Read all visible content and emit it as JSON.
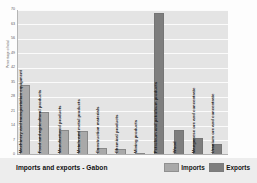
{
  "chart": {
    "title": "Imports and exports - Gabon",
    "ylabel": "Percentage of total"
  },
  "legend": {
    "items": [
      {
        "label": "Imports",
        "color": "#a9a9a9"
      },
      {
        "label": "Exports",
        "color": "#7e7e7e"
      }
    ]
  },
  "colors": {
    "imports": "#a9a9a9",
    "exports": "#7e7e7e",
    "plot_background": "#e4e4e4",
    "gridline": "#fbfbfb",
    "footer_background": "#ededed"
  },
  "chart_data": {
    "type": "bar",
    "title": "Imports and exports - Gabon",
    "subtitle": "",
    "xlabel": "",
    "ylabel": "Percentage of total",
    "ylim": [
      0,
      70
    ],
    "yticks": [
      0,
      7,
      14,
      21,
      28,
      35,
      42,
      49,
      56,
      63,
      70
    ],
    "ytick_labels": [
      "0",
      "7",
      "14",
      "21",
      "28",
      "35",
      "42",
      "49",
      "56",
      "63",
      "70"
    ],
    "grid": true,
    "grid_axis": "y",
    "legend_position": "bottom-right",
    "orientation": "vertical",
    "categories": [
      "Machinery and transportation equipment",
      "Food and agricultural products",
      "Manufactured products",
      "Metals and metal products",
      "Construction materials",
      "Chemical products",
      "Mining products",
      "Petroleum and petroleum products",
      "Wood",
      "Manganese ore and concentrate",
      "Uranium ore and concentrate"
    ],
    "series": [
      {
        "name": "Imports",
        "color": "#a9a9a9",
        "values": [
          34,
          21,
          12,
          11.5,
          3.5,
          3,
          0.7,
          null,
          null,
          null,
          null
        ]
      },
      {
        "name": "Exports",
        "color": "#7e7e7e",
        "values": [
          null,
          null,
          null,
          null,
          null,
          null,
          null,
          68.5,
          12,
          8,
          5.5
        ]
      }
    ],
    "bars": [
      {
        "category": "Machinery and transportation equipment",
        "series": "Imports",
        "value": 34
      },
      {
        "category": "Food and agricultural products",
        "series": "Imports",
        "value": 21
      },
      {
        "category": "Manufactured products",
        "series": "Imports",
        "value": 12
      },
      {
        "category": "Metals and metal products",
        "series": "Imports",
        "value": 11.5
      },
      {
        "category": "Construction materials",
        "series": "Imports",
        "value": 3.5
      },
      {
        "category": "Chemical products",
        "series": "Imports",
        "value": 3
      },
      {
        "category": "Mining products",
        "series": "Imports",
        "value": 0.7
      },
      {
        "category": "Petroleum and petroleum products",
        "series": "Exports",
        "value": 68.5
      },
      {
        "category": "Wood",
        "series": "Exports",
        "value": 12
      },
      {
        "category": "Manganese ore and concentrate",
        "series": "Exports",
        "value": 8
      },
      {
        "category": "Uranium ore and concentrate",
        "series": "Exports",
        "value": 5.5
      }
    ]
  }
}
